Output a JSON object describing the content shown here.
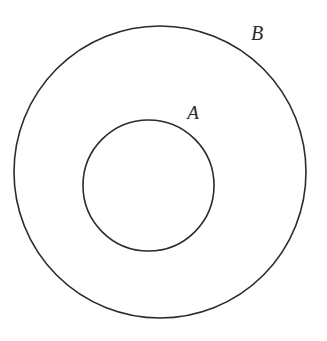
{
  "figure": {
    "kind": "subset-venn-diagram",
    "width": 327,
    "height": 341,
    "background_color": "#ffffff",
    "stroke_color": "#2b2b2b",
    "stroke_width": 1.6
  },
  "chart_data": {
    "type": "diagram",
    "title": "",
    "subtitle": "",
    "xlabel": "",
    "ylabel": "",
    "legend": [],
    "annotations": [
      "A",
      "B"
    ],
    "shapes": [
      {
        "name": "outer-circle",
        "label": "B",
        "shape": "circle",
        "cx": 160,
        "cy": 172,
        "r": 146,
        "fill": "none",
        "stroke": "#2b2b2b",
        "stroke_width": 1.6
      },
      {
        "name": "inner-circle",
        "label": "A",
        "shape": "circle",
        "cx": 148.5,
        "cy": 185.5,
        "r": 65.5,
        "fill": "none",
        "stroke": "#2b2b2b",
        "stroke_width": 1.6
      }
    ]
  },
  "labels": {
    "outer": {
      "text": "B",
      "x": 257,
      "y": 40,
      "font_size": 20,
      "color": "#2b2b2b"
    },
    "inner": {
      "text": "A",
      "x": 193,
      "y": 119,
      "font_size": 19,
      "color": "#2b2b2b"
    }
  }
}
